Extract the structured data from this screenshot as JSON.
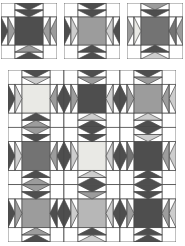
{
  "figure": {
    "goose_order": "outer,inner"
  },
  "palette": {
    "dark": "#4e4e4e",
    "mediumDark": "#737373",
    "medium": "#9c9c9c",
    "mediumLight": "#b7b7b7",
    "light": "#cdcdcd",
    "xlight": "#e9e9e5",
    "white": "#ffffff",
    "line": "#4a4a4a"
  },
  "small_blocks": [
    {
      "name": "block-variation-1",
      "center": "dark",
      "top": [
        "dark",
        "dark"
      ],
      "left": [
        "dark",
        "medium"
      ],
      "right": [
        "medium",
        "medium"
      ],
      "bottom": [
        "dark",
        "medium"
      ]
    },
    {
      "name": "block-variation-2",
      "center": "medium",
      "top": [
        "dark",
        "dark"
      ],
      "left": [
        "dark",
        "light"
      ],
      "right": [
        "dark",
        "light"
      ],
      "bottom": [
        "dark",
        "dark"
      ]
    },
    {
      "name": "block-variation-3",
      "center": "mediumDark",
      "top": [
        "medium",
        "dark"
      ],
      "left": [
        "medium",
        "xlight"
      ],
      "right": [
        "medium",
        "mediumDark"
      ],
      "bottom": [
        "light",
        "dark"
      ]
    }
  ],
  "quilt": {
    "rows": 3,
    "cols": 3,
    "blocks": [
      [
        {
          "center": "xlight",
          "top": [
            "dark",
            "light"
          ],
          "left": [
            "dark",
            "light"
          ],
          "right": [
            "dark",
            "medium"
          ],
          "bottom": [
            "medium",
            "dark"
          ]
        },
        {
          "center": "dark",
          "top": [
            "dark",
            "medium"
          ],
          "left": [
            "dark",
            "medium"
          ],
          "right": [
            "dark",
            "light"
          ],
          "bottom": [
            "dark",
            "light"
          ]
        },
        {
          "center": "medium",
          "top": [
            "dark",
            "medium"
          ],
          "left": [
            "dark",
            "medium"
          ],
          "right": [
            "light",
            "medium"
          ],
          "bottom": [
            "dark",
            "light"
          ]
        }
      ],
      [
        {
          "center": "mediumDark",
          "top": [
            "medium",
            "dark"
          ],
          "left": [
            "dark",
            "light"
          ],
          "right": [
            "dark",
            "medium"
          ],
          "bottom": [
            "medium",
            "dark"
          ]
        },
        {
          "center": "xlight",
          "top": [
            "dark",
            "dark"
          ],
          "left": [
            "dark",
            "light"
          ],
          "right": [
            "dark",
            "light"
          ],
          "bottom": [
            "dark",
            "light"
          ]
        },
        {
          "center": "dark",
          "top": [
            "dark",
            "light"
          ],
          "left": [
            "dark",
            "mediumDark"
          ],
          "right": [
            "light",
            "medium"
          ],
          "bottom": [
            "dark",
            "dark"
          ]
        }
      ],
      [
        {
          "center": "medium",
          "top": [
            "medium",
            "dark"
          ],
          "left": [
            "dark",
            "medium"
          ],
          "right": [
            "dark",
            "dark"
          ],
          "bottom": [
            "dark",
            "medium"
          ]
        },
        {
          "center": "mediumLight",
          "top": [
            "dark",
            "medium"
          ],
          "left": [
            "dark",
            "light"
          ],
          "right": [
            "dark",
            "light"
          ],
          "bottom": [
            "light",
            "dark"
          ]
        },
        {
          "center": "dark",
          "top": [
            "dark",
            "dark"
          ],
          "left": [
            "dark",
            "medium"
          ],
          "right": [
            "light",
            "medium"
          ],
          "bottom": [
            "dark",
            "dark"
          ]
        }
      ]
    ]
  }
}
